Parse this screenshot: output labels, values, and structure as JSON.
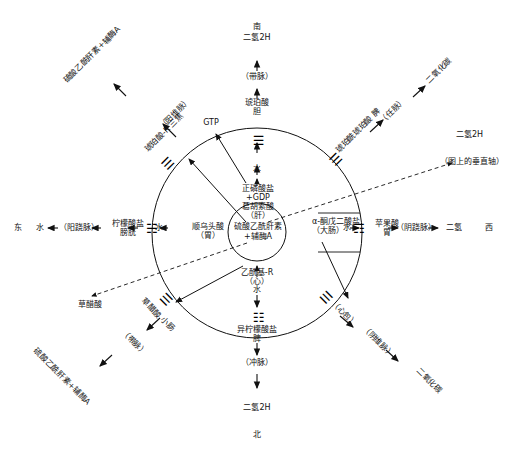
{
  "diagram": {
    "title_center": "硫酸乙酰肝素\n+辅酶A",
    "center_ring_note": "circular TCA / meridian correspondence diagram",
    "axes": {
      "north_label": "北",
      "south_label": "南",
      "east_label": "东",
      "west_label": "西"
    },
    "nodes": {
      "n_top_gas": "二氢2H",
      "n_top_dai": "（带脉）",
      "n_top_succinate": "琥珀酸\n胆",
      "n_top_water": "水",
      "n_gtp": "GTP",
      "n_phosphate": "正磷酸盐\n+GDP\n葛胡索酸\n（肝）",
      "n_center": "硫酸乙酰肝素\n+辅酶A",
      "n_cis_aconitate": "顺乌头酸\n（胃）",
      "n_acetyl": "乙酰基-R\n（心）",
      "n_alpha_keto": "α-酮戊二酸盐\n（大肠）",
      "n_water_right": "水",
      "n_water_left": "水",
      "n_malate": "苹果酸\n胃",
      "n_yinqiao": "（阴跷脉）",
      "n_right_gas": "二氢",
      "n_citrate": "柠檬酸盐\n膀胱",
      "n_yangqiao": "（阳跷脉）",
      "n_left_gas": "水",
      "n_bottom_water": "水",
      "n_isocitrate": "异柠檬酸盐\n脾",
      "n_chongmai": "（冲脉）",
      "n_bottom_gas": "二氢2H",
      "n_oxaloacetate": "草醋酸",
      "n_h2_vertical": "二氢2H",
      "n_h2_vertical_note": "（图上的垂直轴）",
      "n_ne_succinyl": "琥珀酰琥珀酸\n脾",
      "n_ne_renmai": "（任脉）",
      "n_ne_co2": "二氧化碳",
      "n_nw_heparan": "硫酸乙酰肝素+辅酶A",
      "n_nw_yangweimai": "（阳维脉）",
      "n_nw_succinyl": "琥珀酸-R\n三焦",
      "n_sw_oxalo": "草醋酸\n小肠",
      "n_sw_daimai": "（带脉）",
      "n_sw_heparan": "硫酸乙酰肝素+辅酶A",
      "n_se_xinbao": "（心包）",
      "n_se_yinweimai": "（阴维脉）",
      "n_se_co2": "二氧化碳"
    },
    "trigrams": {
      "t_top": "☰",
      "t_right": "☶",
      "t_bottom": "☷",
      "t_left": "☵",
      "t_nw": "☰",
      "t_ne": "☰",
      "t_sw": "☰",
      "t_se": "☰"
    },
    "colors": {
      "stroke": "#111111",
      "background": "#ffffff",
      "text": "#111111"
    }
  }
}
